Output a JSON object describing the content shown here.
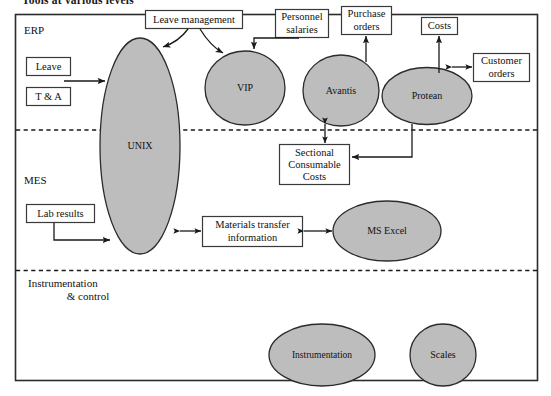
{
  "figure": {
    "title": "Tools at various levels",
    "frame": {
      "border_color": "#2b2b2b",
      "background": "#ffffff"
    },
    "style": {
      "node_fill": "#bdbdbd",
      "node_stroke": "#2b2b2b",
      "box_fill": "#ffffff",
      "box_stroke": "#3a3a3a",
      "arrow_color": "#1a1a1a",
      "divider_color": "#1a1a1a",
      "divider_style": "dashed"
    }
  },
  "zones": [
    {
      "id": "erp",
      "label": "ERP"
    },
    {
      "id": "mes",
      "label": "MES"
    },
    {
      "id": "instrumentation",
      "label": "Instrumentation\n& control",
      "line1": "Instrumentation",
      "line2": "& control"
    }
  ],
  "nodes": [
    {
      "id": "unix",
      "label": "UNIX",
      "zone": "erp/mes",
      "shape": "ellipse"
    },
    {
      "id": "vip",
      "label": "VIP",
      "zone": "erp",
      "shape": "ellipse"
    },
    {
      "id": "avantis",
      "label": "Avantis",
      "zone": "erp",
      "shape": "ellipse"
    },
    {
      "id": "protean",
      "label": "Protean",
      "zone": "erp",
      "shape": "ellipse"
    },
    {
      "id": "msexcel",
      "label": "MS Excel",
      "zone": "mes",
      "shape": "ellipse"
    },
    {
      "id": "instrumentation",
      "label": "Instrumentation",
      "zone": "instrumentation",
      "shape": "ellipse"
    },
    {
      "id": "scales",
      "label": "Scales",
      "zone": "instrumentation",
      "shape": "ellipse"
    }
  ],
  "boxes": [
    {
      "id": "leave_management",
      "label": "Leave management",
      "lines": [
        "Leave management"
      ]
    },
    {
      "id": "personnel_salaries",
      "label": "Personnel salaries",
      "lines": [
        "Personnel",
        "salaries"
      ]
    },
    {
      "id": "purchase_orders",
      "label": "Purchase orders",
      "lines": [
        "Purchase",
        "orders"
      ]
    },
    {
      "id": "costs",
      "label": "Costs",
      "lines": [
        "Costs"
      ]
    },
    {
      "id": "customer_orders",
      "label": "Customer orders",
      "lines": [
        "Customer",
        "orders"
      ]
    },
    {
      "id": "leave",
      "label": "Leave",
      "lines": [
        "Leave"
      ]
    },
    {
      "id": "t_and_a",
      "label": "T & A",
      "lines": [
        "T & A"
      ]
    },
    {
      "id": "sectional_consumable_costs",
      "label": "Sectional Consumable Costs",
      "lines": [
        "Sectional",
        "Consumable",
        "Costs"
      ]
    },
    {
      "id": "lab_results",
      "label": "Lab results",
      "lines": [
        "Lab results"
      ]
    },
    {
      "id": "materials_transfer_information",
      "label": "Materials transfer information",
      "lines": [
        "Materials transfer",
        "information"
      ]
    }
  ],
  "connections": [
    {
      "from": "leave_management",
      "to": "unix",
      "type": "curved-arrow",
      "heads": 1
    },
    {
      "from": "leave_management",
      "to": "vip",
      "type": "curved-arrow",
      "heads": 1
    },
    {
      "from": "personnel_salaries",
      "to": "vip",
      "type": "straight-arrow",
      "heads": 1
    },
    {
      "from": "avantis",
      "to": "purchase_orders",
      "type": "straight-arrow",
      "heads": 1
    },
    {
      "from": "protean",
      "to": "costs",
      "type": "straight-arrow",
      "heads": 1
    },
    {
      "from": "protean",
      "to": "customer_orders",
      "type": "double-arrow",
      "heads": 2
    },
    {
      "from": "leave",
      "to": "unix",
      "type": "straight-arrow",
      "heads": 1
    },
    {
      "from": "avantis",
      "to": "sectional_consumable_costs",
      "type": "double-arrow",
      "heads": 2
    },
    {
      "from": "protean",
      "to": "sectional_consumable_costs",
      "type": "elbow-arrow",
      "heads": 1
    },
    {
      "from": "lab_results",
      "to": "unix",
      "type": "elbow-arrow",
      "heads": 1
    },
    {
      "from": "unix",
      "to": "materials_transfer_information",
      "type": "double-arrow",
      "heads": 2
    },
    {
      "from": "materials_transfer_information",
      "to": "msexcel",
      "type": "double-arrow",
      "heads": 2
    }
  ]
}
